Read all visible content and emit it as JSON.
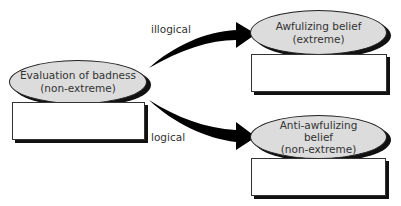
{
  "diagram": {
    "source_node": {
      "line1": "Evaluation of badness",
      "line2": "(non-extreme)"
    },
    "top_node": {
      "line1": "Awfulizing belief",
      "line2": "(extreme)"
    },
    "bottom_node": {
      "line1": "Anti-awfulizing",
      "line2": "belief",
      "line3": "(non-extreme)"
    },
    "edges": {
      "top_label": "illogical",
      "bottom_label": "logical"
    },
    "colors": {
      "ellipse_fill": "#dcdcdc",
      "arrow": "#000000",
      "shadow": "#111111",
      "box_fill": "#ffffff"
    }
  }
}
